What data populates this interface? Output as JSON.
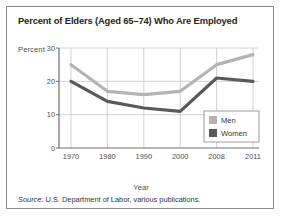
{
  "title": "Percent of Elders (Aged 65–74) Who Are Employed",
  "axis_unit_label": "Percent",
  "xlabel": "Year",
  "source": {
    "prefix": "Source:",
    "text": " U.S. Department of Labor, various publications."
  },
  "legend": {
    "men_label": "Men",
    "women_label": "Women"
  },
  "colors": {
    "men": "#b3b3b3",
    "women": "#58595b",
    "grid": "#c9c9d4",
    "axis": "#6d6e71",
    "border": "#8c8c8c",
    "text": "#231f20"
  },
  "chart_data": {
    "type": "line",
    "title": "Percent of Elders (Aged 65–74) Who Are Employed",
    "xlabel": "Year",
    "ylabel": "Percent",
    "categories": [
      "1970",
      "1980",
      "1990",
      "2000",
      "2008",
      "2011"
    ],
    "yticks": [
      0,
      10,
      20,
      30
    ],
    "ylim": [
      0,
      30
    ],
    "grid": true,
    "legend_position": "bottom-right",
    "series": [
      {
        "name": "Men",
        "values": [
          25,
          17,
          16,
          17,
          25,
          28
        ]
      },
      {
        "name": "Women",
        "values": [
          20,
          14,
          12,
          11,
          21,
          20
        ]
      }
    ],
    "annotation": "Source: U.S. Department of Labor, various publications."
  }
}
